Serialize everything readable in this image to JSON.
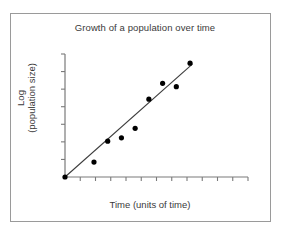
{
  "chart_data": {
    "type": "scatter",
    "title": "Growth of a population over time",
    "xlabel": "Time (units of time)",
    "ylabel_line1": "Log",
    "ylabel_line2": "(population size)",
    "ylabel": "Log (population size)",
    "grid": false,
    "legend": false,
    "xlim": [
      0,
      12
    ],
    "ylim": [
      0,
      7
    ],
    "x_tick_count": 12,
    "y_tick_count": 7,
    "x_tick_labels": [],
    "y_tick_labels": [],
    "axis_color": "#7a7a7a",
    "marker_color": "#000000",
    "line_color": "#3c3c3c",
    "marker_size": 2.6,
    "x": [
      0.0,
      1.9,
      2.8,
      3.7,
      4.6,
      5.5,
      6.4,
      7.3,
      8.2
    ],
    "y": [
      0.0,
      0.85,
      2.04,
      2.23,
      2.77,
      4.43,
      5.33,
      5.14,
      6.48
    ],
    "points": [
      {
        "x": 0.0,
        "y": 0.0
      },
      {
        "x": 1.9,
        "y": 0.85
      },
      {
        "x": 2.8,
        "y": 2.04
      },
      {
        "x": 3.7,
        "y": 2.23
      },
      {
        "x": 4.6,
        "y": 2.77
      },
      {
        "x": 5.5,
        "y": 4.43
      },
      {
        "x": 6.4,
        "y": 5.33
      },
      {
        "x": 7.3,
        "y": 5.14
      },
      {
        "x": 8.2,
        "y": 6.48
      }
    ],
    "trendline": {
      "type": "linear-fit",
      "x_start": 0.0,
      "y_start": 0.0,
      "x_end": 8.35,
      "y_end": 6.42
    }
  }
}
